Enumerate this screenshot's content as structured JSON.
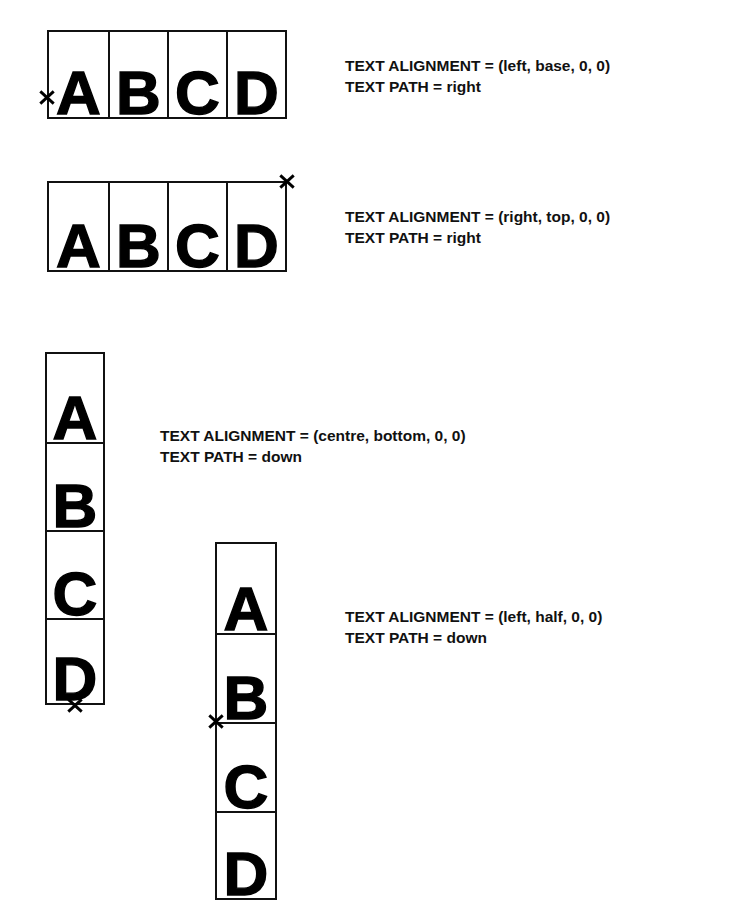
{
  "figure": {
    "letters": [
      "A",
      "B",
      "C",
      "D"
    ],
    "marker_glyph": "x",
    "examples": [
      {
        "id": "left-base-right",
        "letters": [
          "A",
          "B",
          "C",
          "D"
        ],
        "direction": "horizontal",
        "alignment_label": "TEXT ALIGNMENT  =  (left, base, 0, 0)",
        "path_label": "TEXT PATH  =  right",
        "alignment_value": "(left, base, 0, 0)",
        "path_value": "right",
        "marker_position": "left edge, baseline"
      },
      {
        "id": "right-top-right",
        "letters": [
          "A",
          "B",
          "C",
          "D"
        ],
        "direction": "horizontal",
        "alignment_label": "TEXT ALIGNMENT  =  (right, top, 0, 0)",
        "path_label": "TEXT PATH  =  right",
        "alignment_value": "(right, top, 0, 0)",
        "path_value": "right",
        "marker_position": "top-right corner"
      },
      {
        "id": "centre-bottom-down",
        "letters": [
          "A",
          "B",
          "C",
          "D"
        ],
        "direction": "vertical",
        "alignment_label": "TEXT ALIGNMENT  =  (centre, bottom, 0, 0)",
        "path_label": "TEXT PATH  =  down",
        "alignment_value": "(centre, bottom, 0, 0)",
        "path_value": "down",
        "marker_position": "bottom edge, centre"
      },
      {
        "id": "left-half-down",
        "letters": [
          "A",
          "B",
          "C",
          "D"
        ],
        "direction": "vertical",
        "alignment_label": "TEXT ALIGNMENT  =  (left, half, 0, 0)",
        "path_label": "TEXT PATH  =  down",
        "alignment_value": "(left, half, 0, 0)",
        "path_value": "down",
        "marker_position": "left edge, half height"
      }
    ],
    "colors": {
      "ink": "#000000",
      "rule": "#111111",
      "background": "#ffffff"
    }
  }
}
